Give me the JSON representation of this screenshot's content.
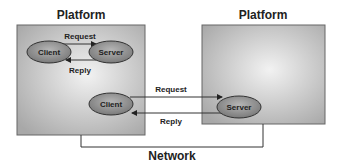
{
  "platforms": [
    {
      "title": "Platform"
    },
    {
      "title": "Platform"
    }
  ],
  "left_platform": {
    "client_top": "Client",
    "server_top": "Server",
    "request_label": "Request",
    "reply_label": "Reply",
    "client_bottom": "Client"
  },
  "right_platform": {
    "server": "Server"
  },
  "network_link": {
    "request_label": "Request",
    "reply_label": "Reply"
  },
  "network_label": "Network",
  "colors": {
    "box_fill_center": "#f0f0f0",
    "box_fill_edge": "#a9a9a9",
    "ellipse_fill": "#8c8c8c",
    "line": "#333333"
  }
}
